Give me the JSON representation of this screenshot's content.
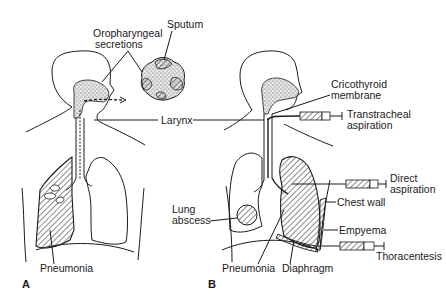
{
  "figure": {
    "panels": [
      {
        "id": "A",
        "label": "A",
        "labels": {
          "oropharyngeal": "Oropharyngeal",
          "secretions": "secretions",
          "sputum": "Sputum",
          "pneumonia": "Pneumonia"
        }
      },
      {
        "id": "B",
        "label": "B",
        "labels": {
          "cricothyroid_1": "Cricothyroid",
          "cricothyroid_2": "membrane",
          "transtracheal_1": "Transtracheal",
          "transtracheal_2": "aspiration",
          "direct_1": "Direct",
          "direct_2": "aspiration",
          "chest_wall": "Chest wall",
          "empyema": "Empyema",
          "thoracentesis": "Thoracentesis",
          "lung_abscess_1": "Lung",
          "lung_abscess_2": "abscess",
          "pneumonia": "Pneumonia",
          "diaphragm": "Diaphragm"
        }
      }
    ],
    "shared_labels": {
      "larynx": "Larynx"
    },
    "colors": {
      "ink": "#1a1a1a",
      "background": "#ffffff"
    }
  }
}
